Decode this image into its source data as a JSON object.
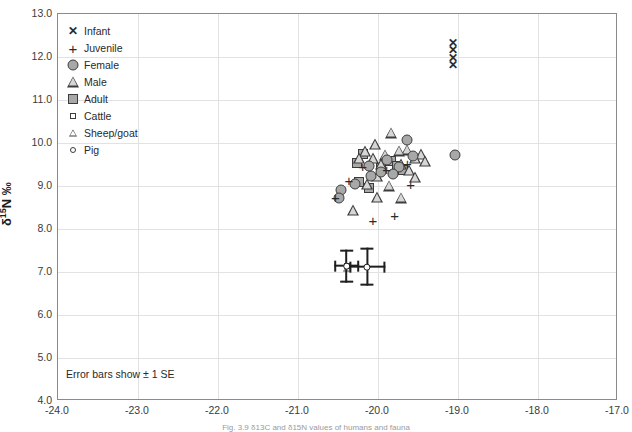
{
  "figure": {
    "caption": "Fig. 3.9  δ13C and δ15N values of humans and fauna",
    "annotation": "Error bars show ± 1 SE"
  },
  "legend": {
    "position": "top-left",
    "items": [
      {
        "label": "Infant",
        "symbol": "ex-icon"
      },
      {
        "label": "Juvenile",
        "symbol": "plus-icon"
      },
      {
        "label": "Female",
        "symbol": "filled-circle-icon"
      },
      {
        "label": "Male",
        "symbol": "open-triangle-icon"
      },
      {
        "label": "Adult",
        "symbol": "filled-square-icon"
      },
      {
        "label": "Cattle",
        "symbol": "small-open-square-icon"
      },
      {
        "label": "Sheep/goat",
        "symbol": "small-open-triangle-icon"
      },
      {
        "label": "Pig",
        "symbol": "small-open-circle-icon"
      }
    ]
  },
  "chart_data": {
    "type": "scatter",
    "title": "",
    "xlabel": "",
    "ylabel": "δ15N ‰",
    "xlim": [
      -24.0,
      -17.0
    ],
    "ylim": [
      4.0,
      13.0
    ],
    "xticks": [
      "-24.0",
      "-23.0",
      "-22.0",
      "-21.0",
      "-20.0",
      "-19.0",
      "-18.0",
      "-17.0"
    ],
    "yticks": [
      "13.0",
      "12.0",
      "11.0",
      "10.0",
      "9.0",
      "8.0",
      "7.0",
      "6.0",
      "5.0",
      "4.0"
    ],
    "grid": true,
    "colors": {
      "marker_fill": "#a8a8a8",
      "marker_edge": "#3c3c3c",
      "errorbar": "#1f1f1f",
      "gridline": "#e2e2e2",
      "frame": "#8a8a8a"
    },
    "series": [
      {
        "name": "Infant",
        "symbol": "ex-icon",
        "points": [
          {
            "x": -19.05,
            "y": 12.3
          },
          {
            "x": -19.05,
            "y": 12.13
          },
          {
            "x": -19.05,
            "y": 11.95
          },
          {
            "x": -19.05,
            "y": 11.8
          }
        ]
      },
      {
        "name": "Juvenile",
        "symbol": "plus-icon",
        "points": [
          {
            "x": -20.18,
            "y": 9.45
          },
          {
            "x": -20.35,
            "y": 9.12
          },
          {
            "x": -20.52,
            "y": 8.73
          },
          {
            "x": -19.88,
            "y": 9.38
          },
          {
            "x": -19.62,
            "y": 9.52
          },
          {
            "x": -19.58,
            "y": 9.02
          },
          {
            "x": -20.05,
            "y": 8.18
          },
          {
            "x": -19.78,
            "y": 8.3
          }
        ]
      },
      {
        "name": "Female",
        "symbol": "filled-circle-icon",
        "points": [
          {
            "x": -19.62,
            "y": 10.05
          },
          {
            "x": -19.55,
            "y": 9.68
          },
          {
            "x": -19.72,
            "y": 9.42
          },
          {
            "x": -19.88,
            "y": 9.58
          },
          {
            "x": -19.95,
            "y": 9.3
          },
          {
            "x": -20.08,
            "y": 9.22
          },
          {
            "x": -20.28,
            "y": 9.02
          },
          {
            "x": -20.45,
            "y": 8.88
          },
          {
            "x": -20.48,
            "y": 8.7
          },
          {
            "x": -19.02,
            "y": 9.7
          },
          {
            "x": -20.1,
            "y": 9.45
          },
          {
            "x": -19.8,
            "y": 9.25
          }
        ]
      },
      {
        "name": "Male",
        "symbol": "open-triangle-icon",
        "points": [
          {
            "x": -19.82,
            "y": 10.22
          },
          {
            "x": -20.02,
            "y": 9.95
          },
          {
            "x": -19.62,
            "y": 9.82
          },
          {
            "x": -19.72,
            "y": 9.8
          },
          {
            "x": -20.15,
            "y": 9.78
          },
          {
            "x": -20.22,
            "y": 9.62
          },
          {
            "x": -20.05,
            "y": 9.62
          },
          {
            "x": -19.9,
            "y": 9.7
          },
          {
            "x": -19.45,
            "y": 9.72
          },
          {
            "x": -19.95,
            "y": 9.48
          },
          {
            "x": -19.7,
            "y": 9.48
          },
          {
            "x": -19.6,
            "y": 9.35
          },
          {
            "x": -19.52,
            "y": 9.18
          },
          {
            "x": -20.0,
            "y": 9.2
          },
          {
            "x": -20.12,
            "y": 9.02
          },
          {
            "x": -19.85,
            "y": 8.98
          },
          {
            "x": -20.0,
            "y": 8.72
          },
          {
            "x": -19.7,
            "y": 8.7
          },
          {
            "x": -20.3,
            "y": 8.42
          },
          {
            "x": -19.52,
            "y": 9.62
          },
          {
            "x": -19.4,
            "y": 9.55
          }
        ]
      },
      {
        "name": "Adult",
        "symbol": "filled-square-icon",
        "points": [
          {
            "x": -20.18,
            "y": 9.72
          },
          {
            "x": -20.25,
            "y": 9.52
          },
          {
            "x": -19.82,
            "y": 9.55
          },
          {
            "x": -19.75,
            "y": 9.45
          },
          {
            "x": -20.22,
            "y": 9.08
          },
          {
            "x": -20.1,
            "y": 8.92
          },
          {
            "x": -19.95,
            "y": 9.4
          },
          {
            "x": -19.68,
            "y": 9.35
          }
        ]
      },
      {
        "name": "Cattle",
        "symbol": "small-open-square-icon",
        "points": [
          {
            "x": -20.38,
            "y": 7.12
          }
        ]
      },
      {
        "name": "Sheep/goat",
        "symbol": "small-open-triangle-icon",
        "points": [
          {
            "x": -20.38,
            "y": 7.08
          }
        ]
      },
      {
        "name": "Pig",
        "symbol": "small-open-circle-icon",
        "points": [
          {
            "x": -20.12,
            "y": 7.1
          }
        ]
      }
    ],
    "error_bars": [
      {
        "group": "Cattle/Sheep-goat",
        "x": -20.38,
        "y": 7.12,
        "xerr": 0.16,
        "yerr": 0.38
      },
      {
        "group": "Pig",
        "x": -20.12,
        "y": 7.1,
        "xerr": 0.22,
        "yerr": 0.45
      }
    ]
  }
}
